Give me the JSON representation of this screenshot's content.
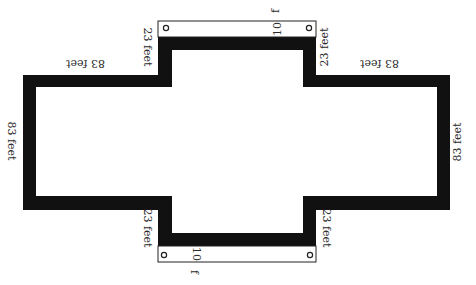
{
  "diagram": {
    "title": "",
    "colors": {
      "wall": "#111111",
      "background": "#ffffff",
      "door_fill": "#ffffff",
      "door_stroke": "#222222",
      "text": "#2a2a2a"
    },
    "labels": {
      "top_left_horizontal": "83 feet",
      "top_right_horizontal": "83 feet",
      "left_vertical": "83 feet",
      "right_vertical": "83 feet",
      "notch_top_left": "23 feet",
      "notch_top_right": "23 feet",
      "notch_bottom_left": "23 feet",
      "notch_bottom_right": "23 feet",
      "door_top_number": "10",
      "door_top_unit": "f",
      "door_bottom_number": "10",
      "door_bottom_unit": "f"
    },
    "doors": [
      {
        "position": "top",
        "width_label": "10 f"
      },
      {
        "position": "bottom",
        "width_label": "10 f"
      }
    ]
  }
}
